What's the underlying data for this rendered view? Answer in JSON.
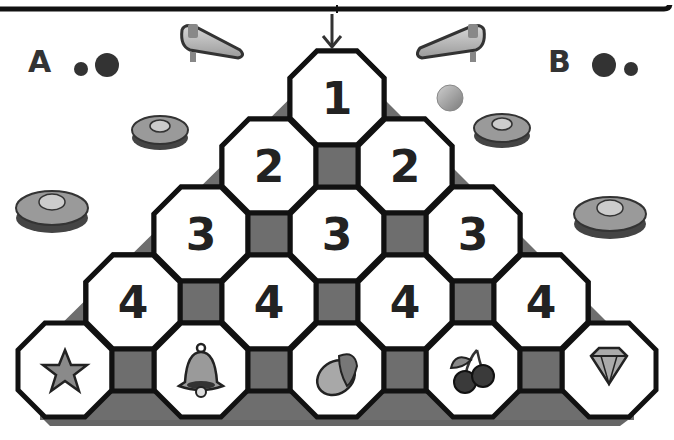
{
  "game": {
    "players": [
      {
        "label": "A",
        "side": "left",
        "dots": [
          "small",
          "large"
        ]
      },
      {
        "label": "B",
        "side": "right",
        "dots": [
          "large",
          "small"
        ]
      }
    ],
    "drop_arrow": "↓",
    "rows": [
      {
        "row": 1,
        "cells": [
          "1"
        ]
      },
      {
        "row": 2,
        "cells": [
          "2",
          "2"
        ]
      },
      {
        "row": 3,
        "cells": [
          "3",
          "3",
          "3"
        ]
      },
      {
        "row": 4,
        "cells": [
          "4",
          "4",
          "4",
          "4"
        ]
      }
    ],
    "bins": [
      {
        "icon": "star-icon",
        "name": "star"
      },
      {
        "icon": "bell-icon",
        "name": "bell"
      },
      {
        "icon": "lemon-icon",
        "name": "lemon"
      },
      {
        "icon": "cherry-icon",
        "name": "cherries"
      },
      {
        "icon": "diamond-icon",
        "name": "diamond"
      }
    ],
    "decorations": [
      "left-flipper",
      "right-flipper",
      "pinball",
      "bumper-left-small",
      "bumper-left-large",
      "bumper-right-small",
      "bumper-right-large"
    ],
    "colors": {
      "board_fill": "#6e6e6e",
      "cell_fill": "#ffffff",
      "outline": "#111111",
      "text": "#222222"
    }
  }
}
